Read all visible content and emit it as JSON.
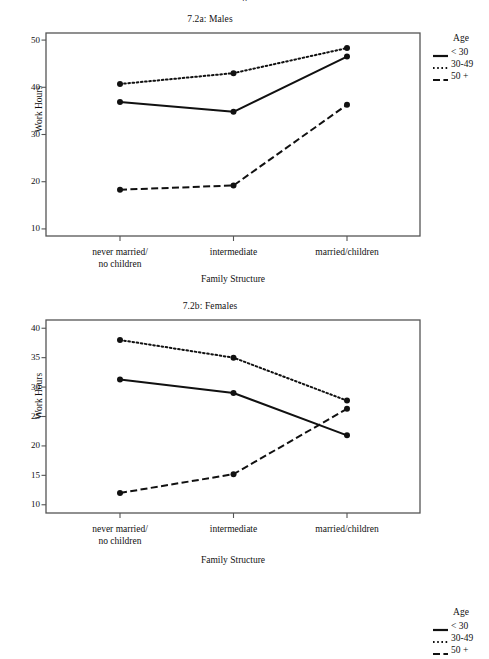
{
  "page": {
    "top_partial_text": "p"
  },
  "legend": {
    "title": "Age",
    "entries": [
      {
        "label": "< 30",
        "style": "solid",
        "name": "legend-item-under-30"
      },
      {
        "label": "30-49",
        "style": "dotted",
        "name": "legend-item-30-49"
      },
      {
        "label": "50 +",
        "style": "dash-dot",
        "name": "legend-item-50-plus"
      }
    ]
  },
  "chart_data": [
    {
      "type": "line",
      "id": "7.2a",
      "title": "7.2a: Males",
      "xlabel": "Family Structure",
      "ylabel": "Work Hours",
      "categories": [
        "never married/\nno children",
        "intermediate",
        "married/children"
      ],
      "category_lines": [
        [
          "never married/",
          "no children"
        ],
        [
          "intermediate"
        ],
        [
          "married/children"
        ]
      ],
      "yticks": [
        10,
        20,
        30,
        40,
        50
      ],
      "ylim": [
        8.5,
        51.5
      ],
      "grid": false,
      "legend_position": "right",
      "markers": "filled-circle",
      "series": [
        {
          "name": "< 30",
          "style": "solid",
          "values": [
            36.9,
            34.8,
            46.5
          ]
        },
        {
          "name": "30-49",
          "style": "dotted",
          "values": [
            40.7,
            43.0,
            48.3
          ]
        },
        {
          "name": "50 +",
          "style": "dash-dot",
          "values": [
            18.3,
            19.2,
            36.3
          ]
        }
      ]
    },
    {
      "type": "line",
      "id": "7.2b",
      "title": "7.2b: Females",
      "xlabel": "Family Structure",
      "ylabel": "Work Hours",
      "categories": [
        "never married/\nno children",
        "intermediate",
        "married/children"
      ],
      "category_lines": [
        [
          "never married/",
          "no children"
        ],
        [
          "intermediate"
        ],
        [
          "married/children"
        ]
      ],
      "yticks": [
        10,
        15,
        20,
        25,
        30,
        35,
        40
      ],
      "ylim": [
        8.6,
        41.4
      ],
      "grid": false,
      "legend_position": "right",
      "markers": "filled-circle",
      "series": [
        {
          "name": "< 30",
          "style": "solid",
          "values": [
            31.3,
            29.0,
            21.8
          ]
        },
        {
          "name": "30-49",
          "style": "dotted",
          "values": [
            38.0,
            35.0,
            27.7
          ]
        },
        {
          "name": "50 +",
          "style": "dash-dot",
          "values": [
            12.0,
            15.2,
            26.3
          ]
        }
      ]
    }
  ],
  "colors": {
    "line": "#111111",
    "frame": "#555555",
    "background": "#ffffff"
  }
}
